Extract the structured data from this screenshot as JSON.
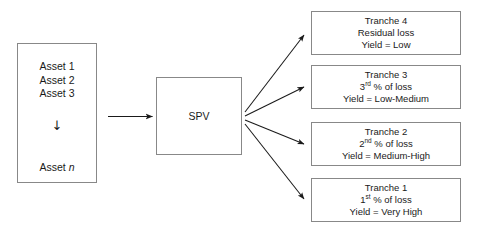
{
  "diagram": {
    "colors": {
      "box_border": "#888888",
      "text": "#1a1a1a",
      "arrow": "#1a1a1a",
      "background": "#ffffff"
    }
  },
  "asset_pool": {
    "name": "asset-pool",
    "lines": [
      "Asset 1",
      "Asset 2",
      "Asset 3"
    ],
    "continuation_glyph": "↓",
    "last_line_prefix": "Asset ",
    "last_line_italic": "n"
  },
  "spv": {
    "label": "SPV"
  },
  "tranches": [
    {
      "id": "tranche-4",
      "title": "Tranche 4",
      "loss_prefix": "Residual loss",
      "loss_ordinal": "",
      "loss_suffix": "",
      "yield": "Yield = Low"
    },
    {
      "id": "tranche-3",
      "title": "Tranche 3",
      "loss_prefix": "3",
      "loss_ordinal": "rd",
      "loss_suffix": " % of loss",
      "yield": "Yield = Low-Medium"
    },
    {
      "id": "tranche-2",
      "title": "Tranche 2",
      "loss_prefix": "2",
      "loss_ordinal": "nd",
      "loss_suffix": " % of loss",
      "yield": "Yield = Medium-High"
    },
    {
      "id": "tranche-1",
      "title": "Tranche 1",
      "loss_prefix": "1",
      "loss_ordinal": "st",
      "loss_suffix": " % of loss",
      "yield": "Yield = Very High"
    }
  ],
  "connectors": {
    "pool_to_spv": "arrow-pool-to-spv",
    "spv_to_tranche_4": "arrow-spv-to-tranche-4",
    "spv_to_tranche_3": "arrow-spv-to-tranche-3",
    "spv_to_tranche_2": "arrow-spv-to-tranche-2",
    "spv_to_tranche_1": "arrow-spv-to-tranche-1"
  }
}
